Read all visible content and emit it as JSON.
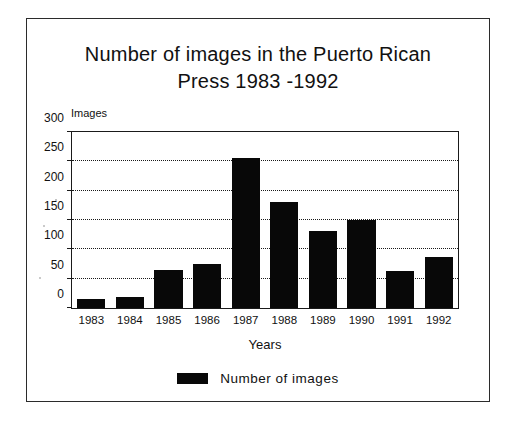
{
  "chart_data": {
    "type": "bar",
    "title": "Number of images in the Puerto Rican Press 1983 -1992",
    "title_line_1": "Number of images in the Puerto Rican",
    "title_line_2": "Press 1983 -1992",
    "xlabel": "Years",
    "ylabel": "Images",
    "categories": [
      "1983",
      "1984",
      "1985",
      "1986",
      "1987",
      "1988",
      "1989",
      "1990",
      "1991",
      "1992"
    ],
    "values": [
      16,
      18,
      64,
      75,
      255,
      181,
      131,
      150,
      63,
      87
    ],
    "series": [
      {
        "name": "Number of images",
        "values": [
          16,
          18,
          64,
          75,
          255,
          181,
          131,
          150,
          63,
          87
        ]
      }
    ],
    "ylim": [
      0,
      300
    ],
    "yticks": [
      0,
      50,
      100,
      150,
      200,
      250,
      300
    ],
    "ytick_labels": [
      "0",
      "50",
      "100",
      "150",
      "200",
      "250",
      "300"
    ],
    "grid": "horizontal-dotted",
    "gridlines_at": [
      50,
      100,
      150,
      200,
      250
    ],
    "legend_position": "bottom-center",
    "bar_color": "#080808",
    "axis_color": "#1a1a1a",
    "background": "#ffffff"
  },
  "legend": {
    "label": "Number of images",
    "swatch_color": "#080808"
  }
}
